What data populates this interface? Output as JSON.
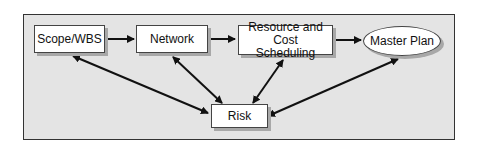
{
  "diagram": {
    "nodes": {
      "scope": {
        "label": "Scope/WBS"
      },
      "network": {
        "label": "Network"
      },
      "resource": {
        "label_line1": "Resource and Cost",
        "label_line2": "Scheduling"
      },
      "master": {
        "label": "Master Plan"
      },
      "risk": {
        "label": "Risk"
      }
    },
    "edges": [
      {
        "from": "Scope/WBS",
        "to": "Network",
        "type": "one-way"
      },
      {
        "from": "Network",
        "to": "Resource and Cost Scheduling",
        "type": "one-way"
      },
      {
        "from": "Resource and Cost Scheduling",
        "to": "Master Plan",
        "type": "one-way"
      },
      {
        "from": "Risk",
        "to": "Scope/WBS",
        "type": "two-way"
      },
      {
        "from": "Risk",
        "to": "Network",
        "type": "two-way"
      },
      {
        "from": "Risk",
        "to": "Resource and Cost Scheduling",
        "type": "two-way"
      },
      {
        "from": "Risk",
        "to": "Master Plan",
        "type": "two-way"
      }
    ]
  }
}
